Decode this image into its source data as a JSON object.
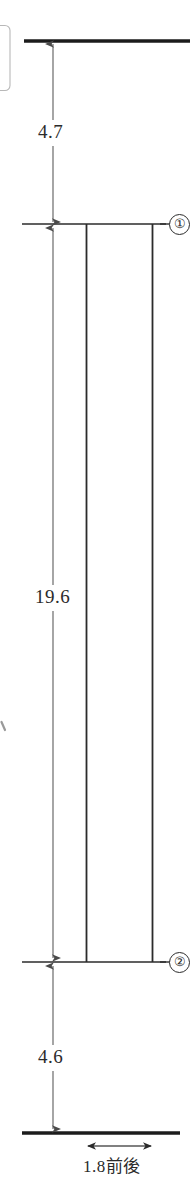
{
  "drawing": {
    "title": "Vertical section dimension drawing",
    "width": 194,
    "height": 1194,
    "line_color": "#2b2b2b",
    "background": "#ffffff"
  },
  "dimensions": {
    "top_gap": {
      "value": "4.7",
      "from": "top-slab",
      "to": "level-1"
    },
    "column_height": {
      "value": "19.6",
      "from": "level-1",
      "to": "level-2"
    },
    "bottom_gap": {
      "value": "4.6",
      "from": "level-2",
      "to": "bottom-slab"
    },
    "width_note": {
      "value": "1.8前後",
      "orientation": "horizontal"
    }
  },
  "markers": [
    {
      "id": "marker-1",
      "label": "①",
      "level": "level-1"
    },
    {
      "id": "marker-2",
      "label": "②",
      "level": "level-2"
    }
  ]
}
